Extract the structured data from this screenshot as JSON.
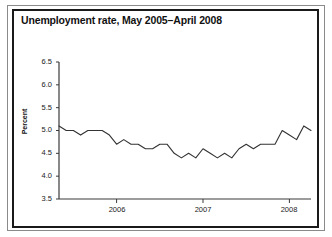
{
  "figure": {
    "title": "Unemployment rate, May 2005–April 2008"
  },
  "chart_data": {
    "type": "line",
    "title": "Unemployment rate, May 2005–April 2008",
    "xlabel": "",
    "ylabel": "Percent",
    "ylim": [
      3.5,
      6.5
    ],
    "ytick_labels": [
      "6.5",
      "6.0",
      "5.5",
      "5.0",
      "4.5",
      "4.0",
      "3.5"
    ],
    "ytick_values": [
      6.5,
      6.0,
      5.5,
      5.0,
      4.5,
      4.0,
      3.5
    ],
    "xtick_labels": [
      "2006",
      "2007",
      "2008"
    ],
    "xtick_values": [
      2006,
      2007,
      2008
    ],
    "xlim_labels": [
      "May 2005",
      "April 2008"
    ],
    "grid": false,
    "legend": false,
    "line_color": "#333333",
    "series": [
      {
        "name": "Unemployment rate",
        "x": [
          "2005-05",
          "2005-06",
          "2005-07",
          "2005-08",
          "2005-09",
          "2005-10",
          "2005-11",
          "2005-12",
          "2006-01",
          "2006-02",
          "2006-03",
          "2006-04",
          "2006-05",
          "2006-06",
          "2006-07",
          "2006-08",
          "2006-09",
          "2006-10",
          "2006-11",
          "2006-12",
          "2007-01",
          "2007-02",
          "2007-03",
          "2007-04",
          "2007-05",
          "2007-06",
          "2007-07",
          "2007-08",
          "2007-09",
          "2007-10",
          "2007-11",
          "2007-12",
          "2008-01",
          "2008-02",
          "2008-03",
          "2008-04"
        ],
        "values": [
          5.1,
          5.0,
          5.0,
          4.9,
          5.0,
          5.0,
          5.0,
          4.9,
          4.7,
          4.8,
          4.7,
          4.7,
          4.6,
          4.6,
          4.7,
          4.7,
          4.5,
          4.4,
          4.5,
          4.4,
          4.6,
          4.5,
          4.4,
          4.5,
          4.4,
          4.6,
          4.7,
          4.6,
          4.7,
          4.7,
          4.7,
          5.0,
          4.9,
          4.8,
          5.1,
          5.0
        ]
      }
    ]
  },
  "axes_geometry": {
    "plot_left_px": 59,
    "plot_right_px": 311,
    "plot_top_px": 62,
    "plot_bottom_px": 199
  }
}
